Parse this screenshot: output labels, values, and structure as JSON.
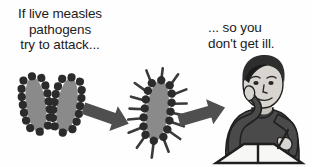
{
  "diagram": {
    "background_color": "#fefefe",
    "text_color": "#1b1b1b",
    "captions": {
      "left": "If live measles\npathogens\ntry to attack...",
      "right": "... so you\ndon't get ill."
    },
    "stages": [
      {
        "name": "live-pathogens",
        "label": "two live measles pathogens",
        "count": 2,
        "body_color": "#8a8a8a",
        "dot_color": "#2b2b2b",
        "has_spikes": false
      },
      {
        "name": "antibody-coated-pathogen",
        "label": "pathogen coated with antibodies",
        "count": 1,
        "body_color": "#8a8a8a",
        "dot_color": "#2b2b2b",
        "spike_color": "#3a3a3a",
        "has_spikes": true
      },
      {
        "name": "healthy-student",
        "label": "student sitting at desk reading a book",
        "skin_color": "#d8d4cf",
        "hair_color": "#2e2e2e",
        "sweater_color": "#4a4a4a",
        "book_color": "#f7f7f5"
      }
    ],
    "arrows": [
      {
        "name": "arrow-pathogens-to-antibodies",
        "direction": "right-down",
        "color": "#4f4f4f"
      },
      {
        "name": "arrow-antibodies-to-student",
        "direction": "right-up",
        "color": "#4f4f4f"
      }
    ]
  }
}
